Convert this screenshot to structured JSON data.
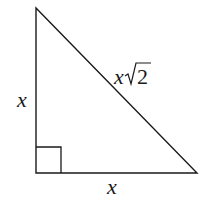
{
  "diagram": {
    "type": "right-isosceles-triangle",
    "labels": {
      "left_leg": "x",
      "bottom_leg": "x",
      "hypotenuse_var": "x",
      "hypotenuse_radicand": "2"
    },
    "colors": {
      "stroke": "#1a1a1a",
      "background": "#ffffff"
    }
  }
}
